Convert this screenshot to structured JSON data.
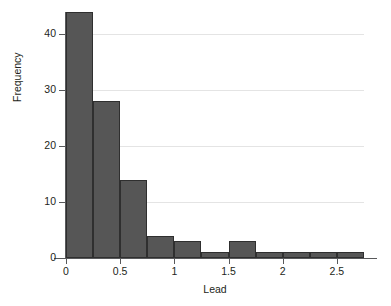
{
  "chart_data": {
    "type": "bar",
    "title": "",
    "subtitle": "",
    "xlabel": "Lead",
    "ylabel": "Frequency",
    "xlim": [
      0,
      2.75
    ],
    "ylim": [
      0,
      44
    ],
    "grid": true,
    "legend": null,
    "bin_width": 0.25,
    "bin_edges": [
      0,
      0.25,
      0.5,
      0.75,
      1.0,
      1.25,
      1.5,
      1.75,
      2.0,
      2.25,
      2.5,
      2.75
    ],
    "categories": [
      "0-0.25",
      "0.25-0.5",
      "0.5-0.75",
      "0.75-1.0",
      "1.0-1.25",
      "1.25-1.5",
      "1.5-1.75",
      "1.75-2.0",
      "2.0-2.25",
      "2.25-2.5",
      "2.5-2.75"
    ],
    "values": [
      44,
      28,
      14,
      4,
      3,
      1,
      3,
      1,
      1,
      1,
      1
    ],
    "x_ticks": [
      {
        "value": 0,
        "label": "0"
      },
      {
        "value": 0.5,
        "label": "0.5"
      },
      {
        "value": 1,
        "label": "1"
      },
      {
        "value": 1.5,
        "label": "1.5"
      },
      {
        "value": 2,
        "label": "2"
      },
      {
        "value": 2.5,
        "label": "2.5"
      }
    ],
    "y_ticks": [
      {
        "value": 0,
        "label": "0"
      },
      {
        "value": 10,
        "label": "10"
      },
      {
        "value": 20,
        "label": "20"
      },
      {
        "value": 30,
        "label": "30"
      },
      {
        "value": 40,
        "label": "40"
      }
    ],
    "colors": {
      "bar_fill": "#565656",
      "bar_stroke": "#2f2f2f",
      "gridline": "#e4e4e4",
      "axis": "#58595b",
      "text": "#231f20",
      "background": "#ffffff"
    }
  }
}
